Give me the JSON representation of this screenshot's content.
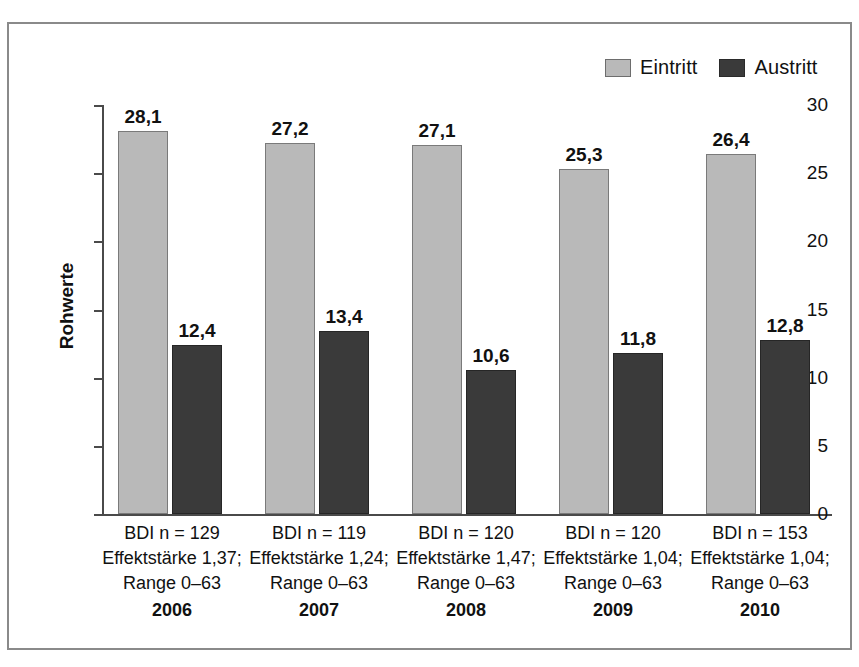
{
  "chart_data": {
    "type": "bar",
    "title": "",
    "xlabel": "",
    "ylabel": "Rohwerte",
    "ylim": [
      0,
      30
    ],
    "yticks": [
      "0",
      "5",
      "10",
      "15",
      "20",
      "25",
      "30"
    ],
    "grid": false,
    "legend_position": "top-right",
    "categories": [
      "2006",
      "2007",
      "2008",
      "2009",
      "2010"
    ],
    "series": [
      {
        "name": "Eintritt",
        "color": "#b9b9b9",
        "values": [
          28.1,
          27.2,
          27.1,
          25.3,
          26.4
        ],
        "labels": [
          "28,1",
          "27,2",
          "27,1",
          "25,3",
          "26,4"
        ]
      },
      {
        "name": "Austritt",
        "color": "#3a3a3a",
        "values": [
          12.4,
          13.4,
          10.6,
          11.8,
          12.8
        ],
        "labels": [
          "12,4",
          "13,4",
          "10,6",
          "11,8",
          "12,8"
        ]
      }
    ],
    "group_annotations": [
      {
        "n": "BDI n = 129",
        "effect": "Effektstärke 1,37;",
        "range": "Range 0–63",
        "year": "2006"
      },
      {
        "n": "BDI n = 119",
        "effect": "Effektstärke 1,24;",
        "range": "Range 0–63",
        "year": "2007"
      },
      {
        "n": "BDI n = 120",
        "effect": "Effektstärke 1,47;",
        "range": "Range 0–63",
        "year": "2008"
      },
      {
        "n": "BDI n = 120",
        "effect": "Effektstärke 1,04;",
        "range": "Range 0–63",
        "year": "2009"
      },
      {
        "n": "BDI n = 153",
        "effect": "Effektstärke 1,04;",
        "range": "Range 0–63",
        "year": "2010"
      }
    ]
  },
  "axis": {
    "y_title": "Rohwerte",
    "ticks": [
      {
        "label": "30",
        "value": 30
      },
      {
        "label": "25",
        "value": 25
      },
      {
        "label": "20",
        "value": 20
      },
      {
        "label": "15",
        "value": 15
      },
      {
        "label": "10",
        "value": 10
      },
      {
        "label": "5",
        "value": 5
      },
      {
        "label": "0",
        "value": 0
      }
    ]
  },
  "legend": {
    "items": [
      {
        "label": "Eintritt",
        "swatch": "light"
      },
      {
        "label": "Austritt",
        "swatch": "dark"
      }
    ]
  }
}
